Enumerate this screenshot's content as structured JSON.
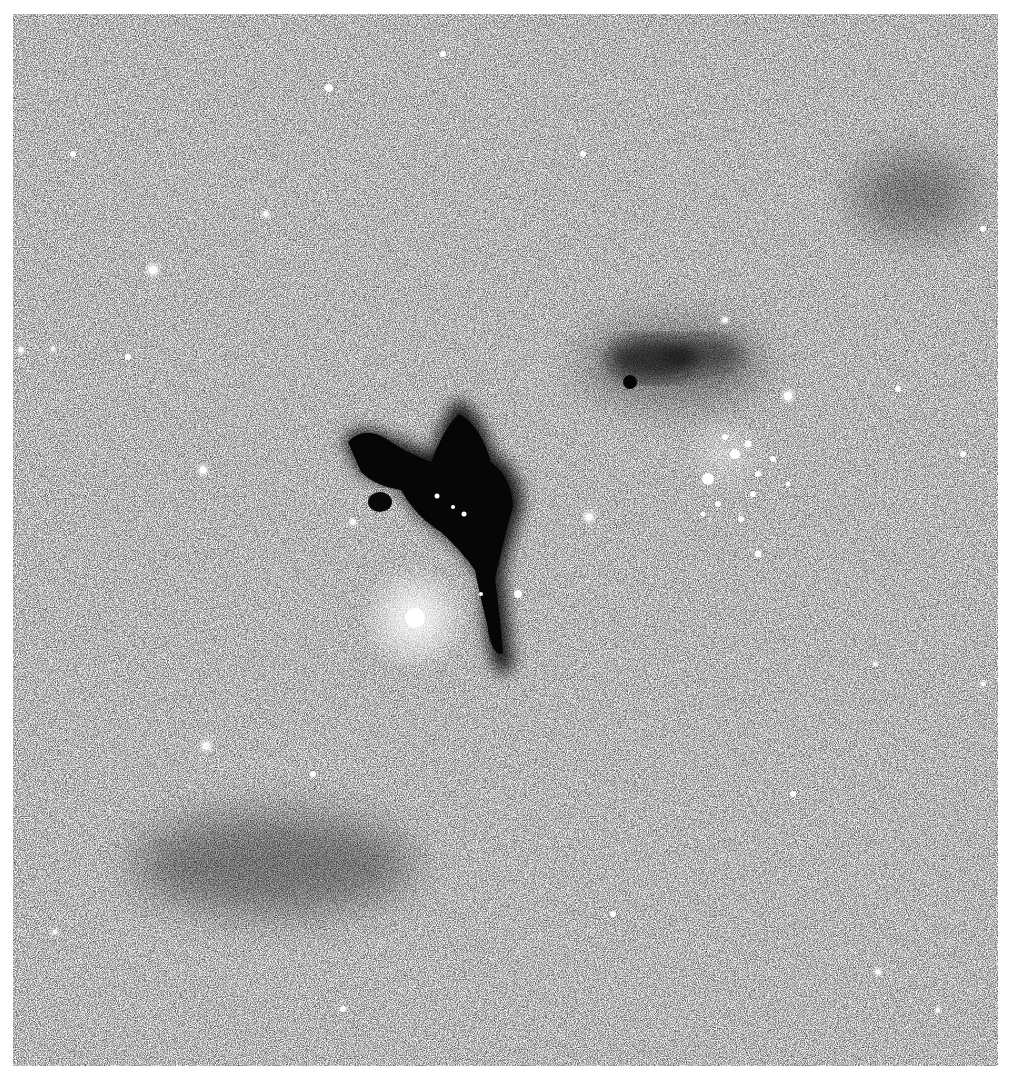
{
  "image": {
    "description": "Grayscale astronomical star field with a dark nebula near the center, a bright star to its lower left, and a bright star cluster to the right",
    "colors": {
      "background": "#ffffff",
      "sky": "#707070",
      "nebula": "#0a0a0a",
      "star": "#ffffff"
    },
    "features": {
      "dark_nebula": {
        "label": "dark-nebula",
        "approx_center": [
          460,
          500
        ]
      },
      "bright_star": {
        "label": "bright-star",
        "approx_center": [
          415,
          618
        ]
      },
      "star_cluster": {
        "label": "star-cluster",
        "approx_center": [
          725,
          460
        ]
      },
      "secondary_dark_cloud": {
        "label": "dark-cloud",
        "approx_center": [
          660,
          355
        ]
      }
    }
  }
}
